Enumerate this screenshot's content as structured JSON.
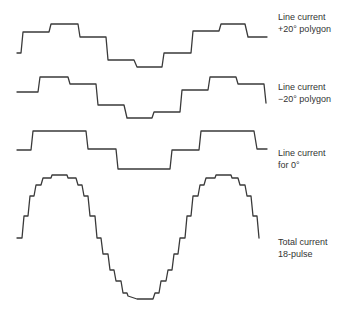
{
  "diagram": {
    "background": "#ffffff",
    "stroke_color": "#3a3a3a",
    "waveforms": [
      {
        "id": "plus20",
        "label_line1": "Line current",
        "label_line2": "+20° polygon",
        "label_top": 11,
        "points": "17,53 21,53 23,32 49,32 51,24 78,24 80,37 106,37 108,60 134,60 137,67 162,67 164,53 191,53 193,31 219,31 221,24 245,24 248,37 267,37"
      },
      {
        "id": "minus20",
        "label_line1": "Line current",
        "label_line2": "−20° polygon",
        "label_top": 81,
        "points": "17,92 38,92 40,77 68,77 70,84 96,84 98,105 124,105 127,118 152,118 154,112 180,112 182,90 208,90 210,77 236,77 238,84 264,84 266,103"
      },
      {
        "id": "zero",
        "label_line1": "Line current",
        "label_line2": "for 0°",
        "label_top": 147,
        "points": "17,150 31,150 33,131 86,131 88,149 116,149 118,169 170,169 172,150 199,150 201,131 254,131 257,149 267,149"
      },
      {
        "id": "total",
        "label_line1": "Total current",
        "label_line2": "18-pulse",
        "label_top": 236,
        "points": "17,238 22,238 24,216 28,216 30,196 34,196 36,185 41,185 43,178 51,178 52,175 67,175 68,178 76,178 78,185 82,185 84,196 88,196 90,216 95,216 97,238 101,238 103,254 108,254 110,270 114,270 116,281 121,281 123,293 127,293 128,296 137,299 153,299 155,293 159,293 161,281 166,281 168,270 172,270 174,254 178,254 180,238 185,238 187,216 191,216 193,196 198,196 200,185 204,185 206,178 215,178 216,175 231,175 232,178 238,178 240,185 245,185 247,196 251,196 253,216 257,216 259,238"
      }
    ]
  }
}
